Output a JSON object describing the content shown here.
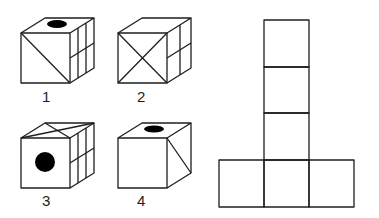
{
  "figure": {
    "cubes": [
      {
        "label": "1",
        "top": "black-oval",
        "front": "diagonal-top-left-to-bottom-right",
        "right": "four-pane-grid"
      },
      {
        "label": "2",
        "top": "blank",
        "front": "x-cross",
        "right": "two-by-two-grid"
      },
      {
        "label": "3",
        "top": "crossed-diagonals",
        "front": "black-circle",
        "right": "four-pane-grid"
      },
      {
        "label": "4",
        "top": "black-oval",
        "front": "blank",
        "right": "diagonal"
      }
    ],
    "net": {
      "shape": "T",
      "squares": 6,
      "layout": "three stacked squares above a row of three"
    }
  },
  "colors": {
    "line": "#1e1e1e",
    "background": "#ffffff",
    "fill": "#000000"
  }
}
